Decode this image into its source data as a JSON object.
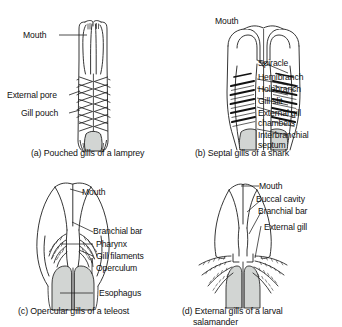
{
  "figure": {
    "background_color": "#ffffff",
    "ink_color": "#1a1a1a",
    "fill_gray": "#d2d5d3"
  },
  "panels": [
    {
      "id": "a",
      "caption": "(a) Pouched gills of a lamprey",
      "organism": "lamprey",
      "labels": [
        {
          "text": "Mouth",
          "name": "label-mouth"
        },
        {
          "text": "External pore",
          "name": "label-external-pore"
        },
        {
          "text": "Gill pouch",
          "name": "label-gill-pouch"
        }
      ]
    },
    {
      "id": "b",
      "caption": "(b) Septal gills of a shark",
      "organism": "shark",
      "labels": [
        {
          "text": "Mouth",
          "name": "label-mouth"
        },
        {
          "text": "Spiracle",
          "name": "label-spiracle"
        },
        {
          "text": "Hemibranch",
          "name": "label-hemibranch"
        },
        {
          "text": "Holobranch",
          "name": "label-holobranch"
        },
        {
          "text": "Gill slit",
          "name": "label-gill-slit"
        },
        {
          "text": "External gill chambers",
          "name": "label-external-gill-chambers"
        },
        {
          "text": "Interbranchial septum",
          "name": "label-interbranchial-septum"
        }
      ]
    },
    {
      "id": "c",
      "caption": "(c) Opercular gills of a teleost",
      "organism": "teleost",
      "labels": [
        {
          "text": "Mouth",
          "name": "label-mouth"
        },
        {
          "text": "Branchial bar",
          "name": "label-branchial-bar"
        },
        {
          "text": "Pharynx",
          "name": "label-pharynx"
        },
        {
          "text": "Gill filaments",
          "name": "label-gill-filaments"
        },
        {
          "text": "Operculum",
          "name": "label-operculum"
        },
        {
          "text": "Esophagus",
          "name": "label-esophagus"
        }
      ]
    },
    {
      "id": "d",
      "caption_line1": "(d) External gills of a larval",
      "caption_line2": "salamander",
      "organism": "larval salamander",
      "labels": [
        {
          "text": "Mouth",
          "name": "label-mouth"
        },
        {
          "text": "Buccal cavity",
          "name": "label-buccal-cavity"
        },
        {
          "text": "Branchial bar",
          "name": "label-branchial-bar"
        },
        {
          "text": "External gill",
          "name": "label-external-gill"
        }
      ]
    }
  ]
}
